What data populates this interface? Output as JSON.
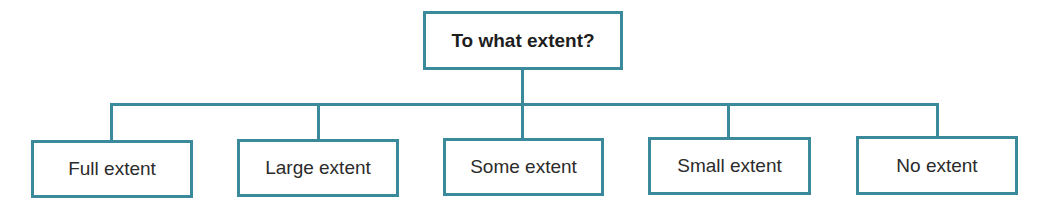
{
  "diagram": {
    "type": "tree",
    "stroke_color": "#3b8a9b",
    "root": {
      "label": "To what extent?"
    },
    "children": [
      {
        "label": "Full extent"
      },
      {
        "label": "Large extent"
      },
      {
        "label": "Some extent"
      },
      {
        "label": "Small extent"
      },
      {
        "label": "No extent"
      }
    ]
  }
}
